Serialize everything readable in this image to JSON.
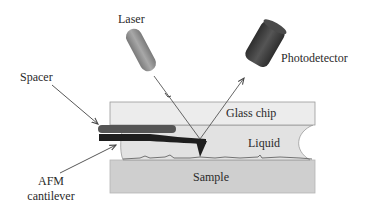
{
  "diagram": {
    "labels": {
      "laser": "Laser",
      "photodetector": "Photodetector",
      "spacer": "Spacer",
      "glass_chip": "Glass chip",
      "liquid": "Liquid",
      "sample": "Sample",
      "afm_cantilever_line1": "AFM",
      "afm_cantilever_line2": "cantilever"
    },
    "colors": {
      "glass_chip": "#ececec",
      "liquid": "#e2e2e2",
      "sample": "#cfcfcf",
      "spacer": "#555555",
      "cantilever": "#1e1e1e",
      "laser": "#8c8c8c",
      "photodetector": "#3c3c3c",
      "beam": "#555555"
    }
  }
}
